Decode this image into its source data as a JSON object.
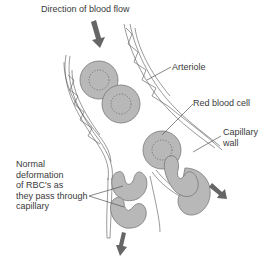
{
  "title": "Direction of blood flow",
  "labels": {
    "arteriole": "Arteriole",
    "red_blood_cell": "Red blood cell",
    "capillary_wall": "Capillary\nwall",
    "deformation": "Normal\ndeformation\nof RBC's as\nthey pass through\ncapillary"
  },
  "colors": {
    "cell_fill": "#b8b8b8",
    "cell_stroke": "#777777",
    "arrow": "#666666",
    "wall": "#555555"
  }
}
